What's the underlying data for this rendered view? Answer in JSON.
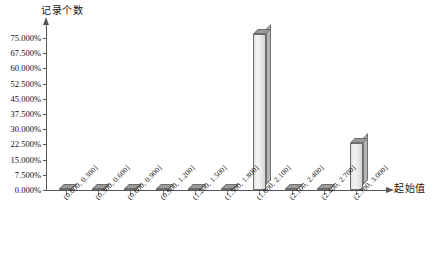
{
  "chart_data": {
    "type": "bar",
    "title": "",
    "subtitle": "",
    "xlabel": "起始值",
    "ylabel": "记录个数",
    "categories": [
      "(0.000, 0.300]",
      "(0.300, 0.600]",
      "(0.600, 0.900]",
      "(0.900, 1.200]",
      "(1.200, 1.500]",
      "(1.500, 1.800]",
      "(1.800, 2.100]",
      "(2.100, 2.400]",
      "(2.400, 2.700]",
      "(2.700, 3.000]"
    ],
    "values": [
      0.0,
      0.0,
      0.0,
      0.0,
      0.0,
      0.0,
      77.0,
      0.0,
      0.0,
      23.0
    ],
    "value_unit": "%",
    "ylim": [
      0,
      75
    ],
    "y_tick_values": [
      0.0,
      7.5,
      15.0,
      22.5,
      30.0,
      37.5,
      45.0,
      52.5,
      60.0,
      67.5,
      75.0
    ],
    "y_tick_labels": [
      "0.000%",
      "7.500%",
      "15.000%",
      "22.500%",
      "30.000%",
      "37.500%",
      "45.000%",
      "52.500%",
      "60.000%",
      "67.500%",
      "75.000%"
    ],
    "grid": false,
    "legend": false,
    "legend_position": "none",
    "bar_style": "3d",
    "colors": {
      "bar_face": "#ececec",
      "bar_top": "#9a9a9a",
      "bar_side": "#b5b5b5",
      "bar_outline": "#6e6e6e",
      "axis": "#555555",
      "text": "#111111",
      "background": "#ffffff"
    }
  }
}
